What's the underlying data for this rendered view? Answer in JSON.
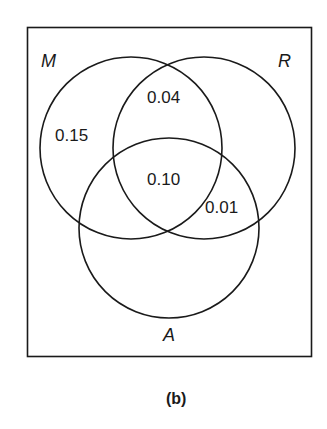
{
  "diagram": {
    "type": "venn",
    "caption": "(b)",
    "sets": {
      "M": {
        "label": "M"
      },
      "R": {
        "label": "R"
      },
      "A": {
        "label": "A"
      }
    },
    "regions": {
      "M_only": "0.15",
      "M_and_R_not_A": "0.04",
      "M_and_R_and_A": "0.10",
      "R_and_A_not_M": "0.01"
    },
    "colors": {
      "stroke": "#1a1a1a",
      "background": "#ffffff"
    }
  }
}
